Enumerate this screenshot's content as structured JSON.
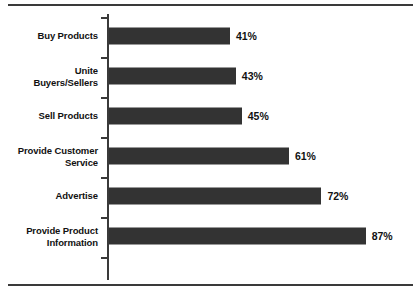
{
  "chart_data": {
    "type": "bar",
    "orientation": "horizontal",
    "title": "",
    "subtitle": "",
    "xlabel": "",
    "ylabel": "",
    "xlim": [
      0,
      100
    ],
    "grid": false,
    "legend": null,
    "value_suffix": "%",
    "categories": [
      "Buy Products",
      "Unite\nBuyers/Sellers",
      "Sell Products",
      "Provide Customer\nService",
      "Advertise",
      "Provide Product\nInformation"
    ],
    "values": [
      41,
      43,
      45,
      61,
      72,
      87
    ],
    "value_labels": [
      "41%",
      "43%",
      "45%",
      "61%",
      "72%",
      "87%"
    ],
    "bar_color": "#333333",
    "axis_color": "#3a3a3a",
    "background_color": "#ffffff",
    "text_color": "#111111"
  }
}
